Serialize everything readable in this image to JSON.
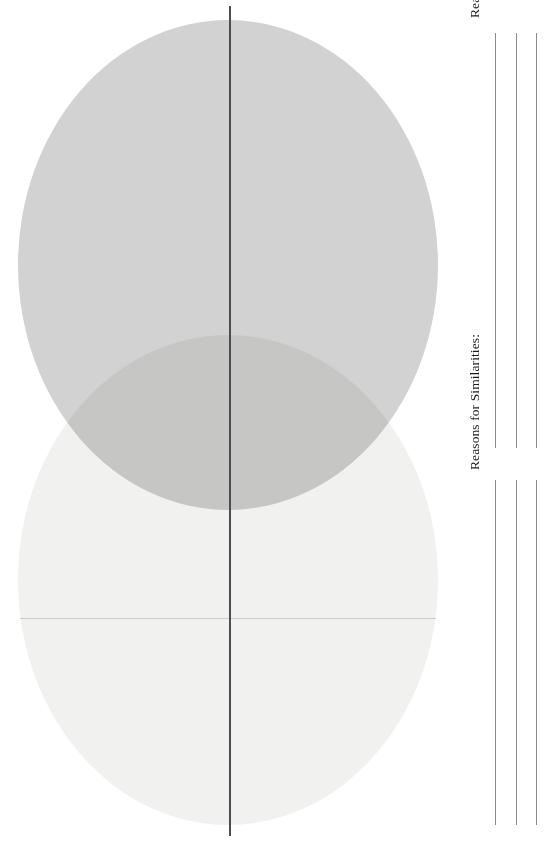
{
  "worksheet": {
    "type": "venn-diagram-worksheet",
    "orientation": "rotated-90-ccw",
    "background_color": "#ffffff"
  },
  "diagram": {
    "name": "venn-diagram",
    "circle_count": 2,
    "has_center_divider": true,
    "circles": [
      {
        "id": "circle-a",
        "label": "",
        "fill_color": "#d2d2d2",
        "position": "upper"
      },
      {
        "id": "circle-b",
        "label": "",
        "fill_color": "#f1f1ef",
        "position": "lower"
      }
    ],
    "overlap": {
      "label": "",
      "fill_color": "#c8c8c8"
    },
    "divider_color": "#4c4c52"
  },
  "prompts": [
    {
      "id": "differences",
      "label": "Reasons for Differences:",
      "line_count": 3,
      "lines": [
        "",
        "",
        ""
      ],
      "line_color": "#8c8c90"
    },
    {
      "id": "similarities",
      "label": "Reasons for Similarities:",
      "line_count": 3,
      "lines": [
        "",
        "",
        ""
      ],
      "line_color": "#8c8c90"
    }
  ]
}
